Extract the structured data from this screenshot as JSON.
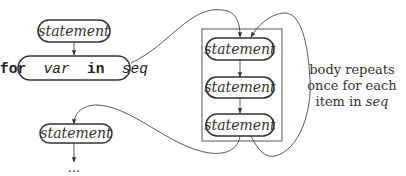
{
  "diagram": {
    "nodes": {
      "stmt_before": {
        "label": "statement"
      },
      "for_header": {
        "kw_for": "for",
        "var": "var",
        "kw_in": "in",
        "seq": "seq"
      },
      "body_1": {
        "label": "statement"
      },
      "body_2": {
        "label": "statement"
      },
      "body_3": {
        "label": "statement"
      },
      "stmt_after": {
        "label": "statement"
      },
      "continuation": {
        "label": "..."
      }
    },
    "annotation": {
      "line1": "body repeats",
      "line2": "once for each",
      "line3_prefix": "item in ",
      "line3_seq": "seq"
    },
    "colors": {
      "stroke": "#333333",
      "text": "#333333",
      "frame": "#555555",
      "background": "#ffffff"
    }
  }
}
